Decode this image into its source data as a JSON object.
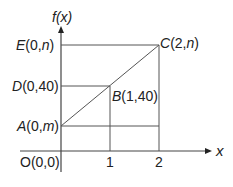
{
  "diagram": {
    "y_axis_label": "f(x)",
    "x_axis_label": "x",
    "origin_label": "O(0,0)",
    "points": {
      "E": {
        "name": "E",
        "coords": "(0,",
        "var": "n",
        "close": ")"
      },
      "D": {
        "name": "D",
        "coords": "(0,40)"
      },
      "A": {
        "name": "A",
        "coords": "(0,",
        "var": "m",
        "close": ")"
      },
      "B": {
        "name": "B",
        "coords": "(1,40)"
      },
      "C": {
        "name": "C",
        "coords": "(2,",
        "var": "n",
        "close": ")"
      }
    },
    "x_ticks": [
      "1",
      "2"
    ],
    "line_color": "#555555"
  }
}
